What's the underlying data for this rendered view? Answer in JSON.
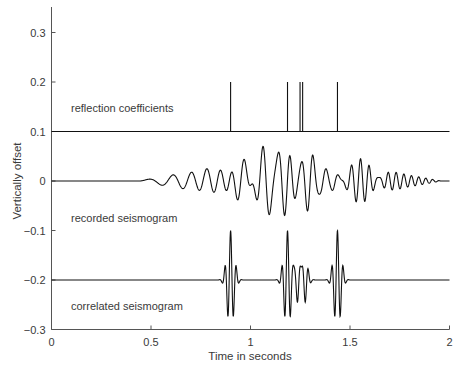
{
  "chart_data": {
    "type": "line",
    "title": "",
    "xlabel": "Time in seconds",
    "ylabel": "Vertically offset",
    "xlim": [
      0,
      2
    ],
    "ylim": [
      -0.3,
      0.35
    ],
    "x_ticks": [
      0,
      0.5,
      1,
      1.5,
      2
    ],
    "x_tick_labels": [
      "0",
      "0.5",
      "1",
      "1.5",
      "2"
    ],
    "y_ticks": [
      0.3,
      0.2,
      0.1,
      0,
      -0.1,
      -0.2,
      -0.3
    ],
    "y_tick_labels": [
      "0.3",
      "0.2",
      "0.1",
      "0",
      "−0.1",
      "−0.2",
      "−0.3"
    ],
    "grid": false,
    "legend": "none",
    "series": [
      {
        "name": "reflection coefficients",
        "offset": 0.1,
        "kind": "spikes",
        "spike_times": [
          0.9,
          1.186,
          1.249,
          1.262,
          1.437
        ],
        "spike_heights": [
          0.1,
          0.1,
          0.1,
          0.1,
          0.1
        ]
      },
      {
        "name": "recorded seismogram",
        "offset": 0,
        "kind": "chirp-convolution",
        "start_time": 0.44,
        "end_time": 1.94,
        "sweep_length_s": 0.5,
        "sweep_f0_hz": 10,
        "sweep_f1_hz": 60,
        "peak_amplitude": 0.07
      },
      {
        "name": "correlated seismogram",
        "offset": -0.2,
        "kind": "klauder-wavelets",
        "centers": [
          0.9,
          1.186,
          1.249,
          1.262,
          1.437
        ],
        "peak_amplitude": 0.1,
        "min_value": -0.29
      }
    ],
    "annotations": [
      {
        "text": "reflection coefficients",
        "x": 0.1,
        "y": 0.14
      },
      {
        "text": "recorded seismogram",
        "x": 0.1,
        "y": -0.075
      },
      {
        "text": "correlated seismogram",
        "x": 0.1,
        "y": -0.255
      }
    ]
  },
  "labels": {
    "xlabel": "Time in seconds",
    "ylabel": "Vertically offset",
    "reflection": "reflection coefficients",
    "recorded": "recorded seismogram",
    "correlated": "correlated seismogram"
  }
}
